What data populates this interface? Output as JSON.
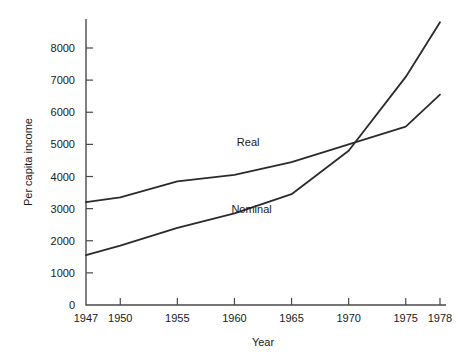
{
  "chart_data": {
    "type": "line",
    "title": "",
    "xlabel": "Year",
    "ylabel": "Per capita income",
    "x": [
      1947,
      1950,
      1955,
      1960,
      1965,
      1970,
      1975,
      1978
    ],
    "xticklabels": [
      "1947",
      "1950",
      "1955",
      "1960",
      "1965",
      "1970",
      "1975",
      "1978"
    ],
    "yticklabels": [
      "0",
      "1000",
      "2000",
      "3000",
      "4000",
      "5000",
      "6000",
      "7000",
      "8000"
    ],
    "yticks": [
      0,
      1000,
      2000,
      3000,
      4000,
      5000,
      6000,
      7000,
      8000
    ],
    "xlim": [
      1947,
      1978
    ],
    "ylim": [
      0,
      8900
    ],
    "grid": false,
    "legend_position": "inline-annotations",
    "series": [
      {
        "name": "Real",
        "label": "Real",
        "color": "#2b2b2b",
        "values": [
          3200,
          3350,
          3850,
          4050,
          4450,
          5000,
          5550,
          6550
        ],
        "label_x": 1961.2,
        "label_y": 4950
      },
      {
        "name": "Nominal",
        "label": "Nominal",
        "color": "#2b2b2b",
        "values": [
          1550,
          1850,
          2400,
          2850,
          3450,
          4800,
          7100,
          8800
        ],
        "label_x": 1961.5,
        "label_y": 2850
      }
    ],
    "annotations": [
      {
        "text": "Real",
        "x": 1961.2,
        "y": 4950
      },
      {
        "text": "Nominal",
        "x": 1961.5,
        "y": 2850
      }
    ]
  }
}
